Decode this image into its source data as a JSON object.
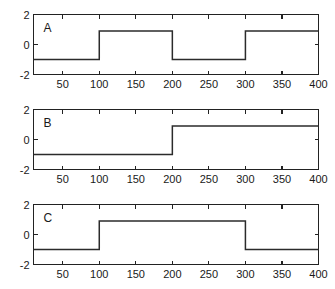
{
  "figure": {
    "width": 335,
    "height": 289,
    "background_color": "#ffffff",
    "line_color": "#2b2b2b",
    "axis_color": "#222222"
  },
  "chart_data": [
    {
      "type": "line",
      "title": "",
      "panel_label": "A",
      "xlabel": "",
      "ylabel": "",
      "xlim": [
        10,
        400
      ],
      "ylim": [
        -2,
        2
      ],
      "xticks": [
        50,
        100,
        150,
        200,
        250,
        300,
        350,
        400
      ],
      "xticklabels": [
        "50",
        "100",
        "150",
        "200",
        "250",
        "300",
        "350",
        "400"
      ],
      "yticks": [
        -2,
        0,
        2
      ],
      "yticklabels": [
        "-2",
        "0",
        "2"
      ],
      "grid": false,
      "legend": null,
      "description": "Square wave alternating between -1 and 0.9 with transitions at x=100, 200 and 300",
      "x": [
        10,
        100,
        100,
        200,
        200,
        300,
        300,
        400
      ],
      "y": [
        -1.0,
        -1.0,
        0.9,
        0.9,
        -1.0,
        -1.0,
        0.9,
        0.9
      ]
    },
    {
      "type": "line",
      "title": "",
      "panel_label": "B",
      "xlabel": "",
      "ylabel": "",
      "xlim": [
        10,
        400
      ],
      "ylim": [
        -2,
        2
      ],
      "xticks": [
        50,
        100,
        150,
        200,
        250,
        300,
        350,
        400
      ],
      "xticklabels": [
        "50",
        "100",
        "150",
        "200",
        "250",
        "300",
        "350",
        "400"
      ],
      "yticks": [
        -2,
        0,
        2
      ],
      "yticklabels": [
        "-2",
        "0",
        "2"
      ],
      "grid": false,
      "legend": null,
      "description": "Single upward step from -1 to 0.9 at x=200",
      "x": [
        10,
        200,
        200,
        400
      ],
      "y": [
        -1.0,
        -1.0,
        0.9,
        0.9
      ]
    },
    {
      "type": "line",
      "title": "",
      "panel_label": "C",
      "xlabel": "",
      "ylabel": "",
      "xlim": [
        10,
        400
      ],
      "ylim": [
        -2,
        2
      ],
      "xticks": [
        50,
        100,
        150,
        200,
        250,
        300,
        350,
        400
      ],
      "xticklabels": [
        "50",
        "100",
        "150",
        "200",
        "250",
        "300",
        "350",
        "400"
      ],
      "yticks": [
        -2,
        0,
        2
      ],
      "yticklabels": [
        "-2",
        "0",
        "2"
      ],
      "grid": false,
      "legend": null,
      "description": "Single pulse: low at -1, high at 0.9 between x=100 and x=300, then low again",
      "x": [
        10,
        100,
        100,
        300,
        300,
        400
      ],
      "y": [
        -1.0,
        -1.0,
        0.9,
        0.9,
        -1.0,
        -1.0
      ]
    }
  ]
}
